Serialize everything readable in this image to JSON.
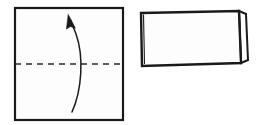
{
  "figure": {
    "background_color": "#ffffff",
    "ink_color": "#1a1a1a",
    "paper_fill": "#fdfdfd",
    "width": 264,
    "height": 125
  },
  "panels": [
    {
      "id": "panel-before-fold",
      "name": "square-sheet-with-fold-line",
      "caption": "",
      "shape": "square",
      "bounds": {
        "x": 15,
        "y": 8,
        "width": 108,
        "height": 112
      },
      "stroke_width": 2.2,
      "fold_line": {
        "name": "horizontal-fold-crease",
        "style": "dashed",
        "orientation": "horizontal",
        "y": 64,
        "x_start": 15,
        "x_end": 123,
        "dash_length": 6,
        "dash_gap": 5,
        "stroke_width": 1.4
      },
      "arrow": {
        "name": "fold-direction-arrow",
        "style": "curved",
        "direction": "upward",
        "start": {
          "x": 72,
          "y": 112
        },
        "end": {
          "x": 68,
          "y": 16
        },
        "bow": "right",
        "stroke_width": 1.5,
        "head_length": 14,
        "head_width": 7
      }
    },
    {
      "id": "panel-after-fold",
      "name": "folded-rectangle-result",
      "caption": "",
      "shape": "rectangle",
      "bounds": {
        "x": 140,
        "y": 10,
        "width": 108,
        "height": 57
      },
      "stroke_width": 2.2,
      "tilt": "slight",
      "fold_spine": {
        "name": "left-fold-spine",
        "edge": "left",
        "double_line": true
      },
      "loose_flap": {
        "name": "right-open-edge-flap",
        "edge": "right",
        "width": 7,
        "slant": 3
      },
      "outline_points": "141,13 239,11 241,63 142,66",
      "flap_points": "239,11 246,14 248,60 241,63"
    }
  ]
}
